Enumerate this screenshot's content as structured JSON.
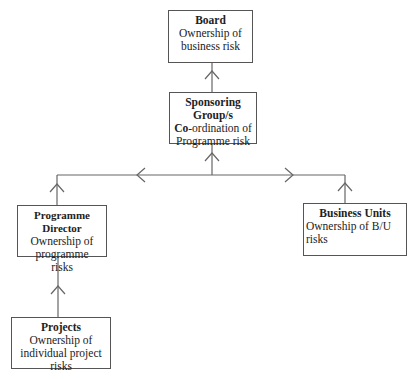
{
  "diagram": {
    "type": "hierarchy",
    "nodes": {
      "board": {
        "title": "Board",
        "desc": "Ownership of business risk"
      },
      "sponsoring": {
        "title_line1": "Sponsoring",
        "title_line2": "Group/s",
        "desc_bold": "Co",
        "desc_rest": "-ordination of Programme risk"
      },
      "programme_director": {
        "title": "Programme Director",
        "desc": "Ownership of programme risks"
      },
      "business_units": {
        "title": "Business Units",
        "desc": "Ownership of B/U risks"
      },
      "projects": {
        "title": "Projects",
        "desc": "Ownership of individual project risks"
      }
    },
    "edges": [
      {
        "from": "Sponsoring Group/s",
        "to": "Board",
        "direction": "up"
      },
      {
        "from": "Programme Director",
        "to": "Sponsoring Group/s",
        "direction": "up"
      },
      {
        "from": "Business Units",
        "to": "Sponsoring Group/s",
        "direction": "up"
      },
      {
        "from": "Projects",
        "to": "Programme Director",
        "direction": "up"
      }
    ],
    "line_color": "#666666"
  }
}
